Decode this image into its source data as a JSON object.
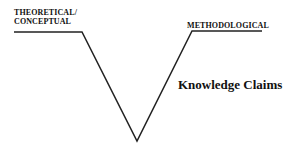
{
  "diagram": {
    "left_label_line1": "THEORETICAL/",
    "left_label_line2": "CONCEPTUAL",
    "right_label": "METHODOLOGICAL",
    "center_label": "Knowledge Claims",
    "line_color": "#222222",
    "shape": "V with horizontal shoulders"
  }
}
